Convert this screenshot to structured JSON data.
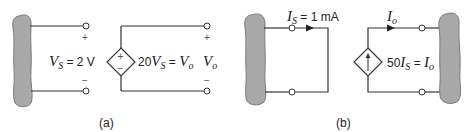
{
  "panels": {
    "a": {
      "caption": "(a)",
      "input_label": {
        "symbol": "V",
        "subscript": "S",
        "rest": " = 2 V"
      },
      "input_polarity": {
        "plus": "+",
        "minus": "−"
      },
      "source_type": "voltage-controlled voltage source",
      "source_signs": {
        "plus": "+",
        "minus": "−"
      },
      "source_label": {
        "coef": "20",
        "symbol": "V",
        "subscript": "S",
        "eq": " = ",
        "out_symbol": "V",
        "out_subscript": "o"
      },
      "output_label": {
        "symbol": "V",
        "subscript": "o"
      },
      "output_polarity": {
        "plus": "+",
        "minus": "−"
      }
    },
    "b": {
      "caption": "(b)",
      "input_label": {
        "symbol": "I",
        "subscript": "S",
        "rest": " = 1 mA"
      },
      "source_type": "current-controlled current source",
      "source_label": {
        "coef": "50",
        "symbol": "I",
        "subscript": "S",
        "eq": " = ",
        "out_symbol": "I",
        "out_subscript": "o"
      },
      "output_label": {
        "symbol": "I",
        "subscript": "o"
      }
    }
  },
  "colors": {
    "wire": "#333333",
    "blob_fill": "#a9a9a9",
    "blob_stroke": "#7a7a7a",
    "terminal_fill": "#ffffff"
  }
}
